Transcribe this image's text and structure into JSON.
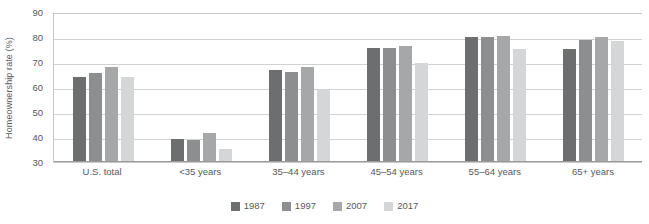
{
  "chart_data": {
    "type": "bar",
    "title": "",
    "subtitle": "",
    "xlabel": "",
    "ylabel": "Homeownership rate (%)",
    "ylim": [
      30,
      90
    ],
    "yticks": [
      90,
      80,
      70,
      60,
      50,
      40,
      30
    ],
    "grid": true,
    "legend_position": "bottom",
    "categories": [
      "U.S. total",
      "<35 years",
      "35–44 years",
      "45–54 years",
      "55–64 years",
      "65+ years"
    ],
    "series": [
      {
        "name": "1987",
        "color": "#6d6e70",
        "values": [
          64.0,
          39.2,
          66.8,
          75.6,
          80.0,
          75.2
        ]
      },
      {
        "name": "1997",
        "color": "#8d8e90",
        "values": [
          65.7,
          38.7,
          66.1,
          75.5,
          80.1,
          78.9
        ]
      },
      {
        "name": "2007",
        "color": "#a6a7a9",
        "values": [
          68.1,
          41.5,
          68.2,
          76.3,
          80.5,
          80.0
        ]
      },
      {
        "name": "2017",
        "color": "#d5d6d7",
        "values": [
          63.9,
          35.3,
          58.9,
          69.6,
          75.2,
          78.3
        ]
      }
    ]
  },
  "axis": {
    "y_title": "Homeownership rate (%)"
  }
}
